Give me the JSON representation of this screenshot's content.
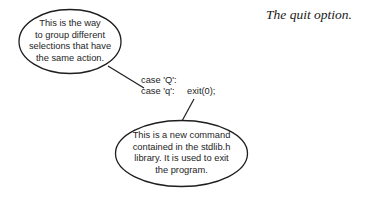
{
  "caption": "The quit option.",
  "code": {
    "line1": "case 'Q':",
    "line2_case": "case 'q':",
    "line2_stmt": "exit(0);"
  },
  "callouts": [
    {
      "id": "grouping",
      "lines": [
        "This is the way",
        "to group different",
        "selections that have",
        "the same action."
      ],
      "points_to": "case labels"
    },
    {
      "id": "exit",
      "lines": [
        "This is a new command",
        "contained in the stdlib.h",
        "library. It is used to exit",
        "the program."
      ],
      "points_to": "exit(0);"
    }
  ],
  "colors": {
    "stroke": "#1e1e1e",
    "text": "#1e1e1e",
    "background": "#ffffff"
  }
}
